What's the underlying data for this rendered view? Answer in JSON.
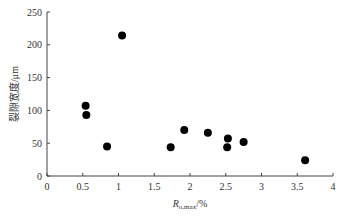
{
  "chart_data": {
    "type": "scatter",
    "title": "",
    "xlabel": "R_o,max/%",
    "xlabel_main": "R",
    "xlabel_sub": "o,max",
    "xlabel_unit": "/%",
    "ylabel": "裂隙宽度/μm",
    "xlim": [
      0,
      4
    ],
    "ylim": [
      0,
      250
    ],
    "xticks": [
      0,
      0.5,
      1,
      1.5,
      2,
      2.5,
      3,
      3.5,
      4
    ],
    "xtick_labels": [
      "0",
      "0.5",
      "1",
      "1.5",
      "2",
      "2.5",
      "3",
      "3.5",
      "4"
    ],
    "yticks": [
      0,
      50,
      100,
      150,
      200,
      250
    ],
    "ytick_labels": [
      "0",
      "50",
      "100",
      "150",
      "200",
      "250"
    ],
    "grid": false,
    "legend": null,
    "marker_color": "#000000",
    "points": [
      {
        "x": 0.54,
        "y": 107
      },
      {
        "x": 0.55,
        "y": 93
      },
      {
        "x": 0.84,
        "y": 45
      },
      {
        "x": 1.05,
        "y": 214
      },
      {
        "x": 1.73,
        "y": 44
      },
      {
        "x": 1.92,
        "y": 70
      },
      {
        "x": 2.25,
        "y": 66
      },
      {
        "x": 2.53,
        "y": 57
      },
      {
        "x": 2.52,
        "y": 44
      },
      {
        "x": 2.75,
        "y": 52
      },
      {
        "x": 3.61,
        "y": 24
      }
    ]
  }
}
